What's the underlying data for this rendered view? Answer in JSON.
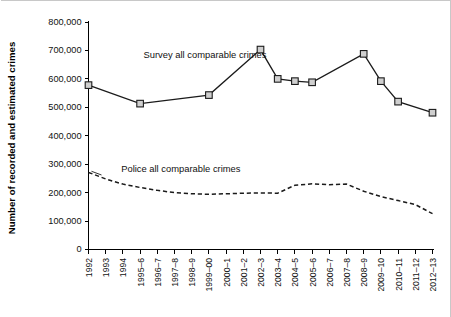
{
  "chart_data": {
    "type": "line",
    "title": "",
    "xlabel": "",
    "ylabel": "Number of recorded and estimated crimes",
    "ylim": [
      0,
      800000
    ],
    "ytick_labels": [
      "0",
      "100,000",
      "200,000",
      "300,000",
      "400,000",
      "500,000",
      "600,000",
      "700,000",
      "800,000"
    ],
    "ytick_values": [
      0,
      100000,
      200000,
      300000,
      400000,
      500000,
      600000,
      700000,
      800000
    ],
    "grid": false,
    "legend_position": "inline-annotation",
    "categories": [
      "1992",
      "1993",
      "1994",
      "1995–6",
      "1996–7",
      "1997–8",
      "1998–9",
      "1999–00",
      "2000–1",
      "2001–2",
      "2002–3",
      "2003–4",
      "2004–5",
      "2005–6",
      "2006–7",
      "2007–8",
      "2008–9",
      "2009–10",
      "2010–11",
      "2011–12",
      "2012–13"
    ],
    "series": [
      {
        "name": "Survey all comparable crimes",
        "style": "solid-with-square-markers",
        "marker": "square",
        "color": "#1b1b1b",
        "label_x_frac": 0.16,
        "label_y_value": 672000,
        "points": [
          {
            "category": "1992",
            "value": 578000
          },
          {
            "category": "1995–6",
            "value": 513000
          },
          {
            "category": "1999–00",
            "value": 543000
          },
          {
            "category": "2002–3",
            "value": 703000
          },
          {
            "category": "2003–4",
            "value": 600000
          },
          {
            "category": "2004–5",
            "value": 592000
          },
          {
            "category": "2005–6",
            "value": 588000
          },
          {
            "category": "2008–9",
            "value": 688000
          },
          {
            "category": "2009–10",
            "value": 592000
          },
          {
            "category": "2010–11",
            "value": 520000
          },
          {
            "category": "2012–13",
            "value": 481000
          }
        ]
      },
      {
        "name": "Police all comparable crimes",
        "style": "dashed",
        "marker": "none",
        "color": "#1b1b1b",
        "label_x_frac": 0.095,
        "label_y_value": 272000,
        "points": [
          {
            "category": "1992",
            "value": 271000
          },
          {
            "category": "1993",
            "value": 248000
          },
          {
            "category": "1994",
            "value": 230000
          },
          {
            "category": "1995–6",
            "value": 218000
          },
          {
            "category": "1996–7",
            "value": 208000
          },
          {
            "category": "1997–8",
            "value": 200000
          },
          {
            "category": "1998–9",
            "value": 196000
          },
          {
            "category": "1999–00",
            "value": 194000
          },
          {
            "category": "2000–1",
            "value": 196000
          },
          {
            "category": "2001–2",
            "value": 198000
          },
          {
            "category": "2002–3",
            "value": 199000
          },
          {
            "category": "2003–4",
            "value": 198000
          },
          {
            "category": "2004–5",
            "value": 226000
          },
          {
            "category": "2005–6",
            "value": 231000
          },
          {
            "category": "2006–7",
            "value": 228000
          },
          {
            "category": "2007–8",
            "value": 230000
          },
          {
            "category": "2008–9",
            "value": 205000
          },
          {
            "category": "2009–10",
            "value": 186000
          },
          {
            "category": "2010–11",
            "value": 172000
          },
          {
            "category": "2011–12",
            "value": 158000
          },
          {
            "category": "2012–13",
            "value": 126000
          }
        ]
      }
    ]
  }
}
